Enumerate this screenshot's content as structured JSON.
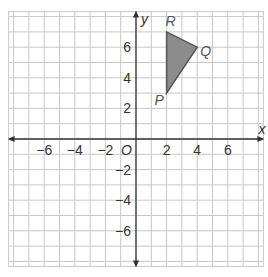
{
  "graph": {
    "x_axis_label": "x",
    "y_axis_label": "y",
    "origin_label": "O",
    "x_range": [
      -8,
      8
    ],
    "y_range": [
      -8,
      8
    ],
    "x_ticks": [
      {
        "value": -6,
        "label": "−6"
      },
      {
        "value": -4,
        "label": "−4"
      },
      {
        "value": -2,
        "label": "−2"
      },
      {
        "value": 2,
        "label": "2"
      },
      {
        "value": 4,
        "label": "4"
      },
      {
        "value": 6,
        "label": "6"
      }
    ],
    "y_ticks": [
      {
        "value": 6,
        "label": "6"
      },
      {
        "value": 4,
        "label": "4"
      },
      {
        "value": 2,
        "label": "2"
      },
      {
        "value": -2,
        "label": "−2"
      },
      {
        "value": -4,
        "label": "−4"
      },
      {
        "value": -6,
        "label": "−6"
      }
    ],
    "colors": {
      "grid": "#c8c8c8",
      "axis": "#333333",
      "triangle_fill": "#8c8c8c",
      "triangle_stroke": "#555555"
    }
  },
  "triangle": {
    "name": "PQR",
    "vertices": [
      {
        "label": "P",
        "x": 2,
        "y": 3
      },
      {
        "label": "Q",
        "x": 4,
        "y": 6
      },
      {
        "label": "R",
        "x": 2,
        "y": 7
      }
    ]
  }
}
